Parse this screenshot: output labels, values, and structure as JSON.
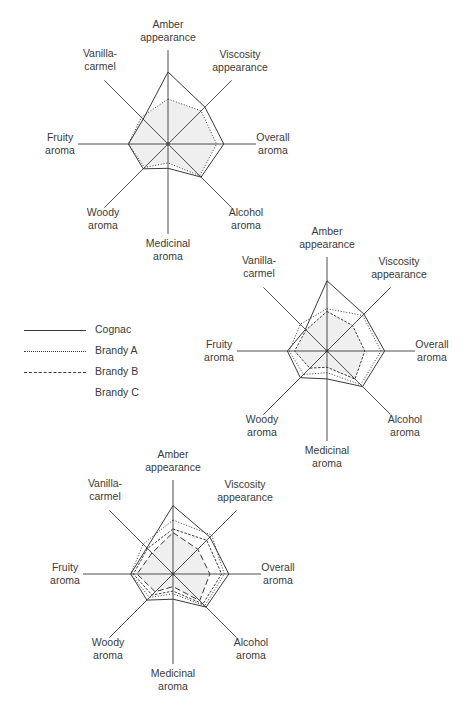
{
  "chart_data": [
    {
      "type": "radar",
      "title": "",
      "center": [
        168,
        144
      ],
      "radius_px": 90,
      "scale": [
        0,
        10
      ],
      "grid": false,
      "axes": [
        "Amber appearance",
        "Viscosity appearance",
        "Overall aroma",
        "Alcohol aroma",
        "Medicinal aroma",
        "Woody aroma",
        "Fruity aroma",
        "Vanilla-carmel"
      ],
      "series": [
        {
          "name": "Cognac",
          "style": "solid",
          "values": [
            8.0,
            5.8,
            6.2,
            5.2,
            2.7,
            3.9,
            4.4,
            3.9
          ]
        },
        {
          "name": "Brandy A",
          "style": "dotted",
          "values": [
            5.0,
            5.2,
            5.4,
            5.0,
            2.1,
            3.7,
            4.4,
            4.2
          ]
        }
      ]
    },
    {
      "type": "radar",
      "title": "",
      "center": [
        327,
        351
      ],
      "radius_px": 90,
      "scale": [
        0,
        10
      ],
      "grid": false,
      "axes": [
        "Amber appearance",
        "Viscosity appearance",
        "Overall aroma",
        "Alcohol aroma",
        "Medicinal aroma",
        "Woody aroma",
        "Fruity aroma",
        "Vanilla-carmel"
      ],
      "series": [
        {
          "name": "Cognac",
          "style": "solid",
          "values": [
            7.8,
            5.8,
            6.4,
            5.6,
            3.1,
            4.2,
            4.4,
            3.4
          ]
        },
        {
          "name": "Brandy A",
          "style": "dotted",
          "values": [
            4.7,
            5.6,
            6.0,
            5.3,
            2.4,
            3.7,
            4.2,
            4.2
          ]
        },
        {
          "name": "Brandy B",
          "style": "short-dash",
          "values": [
            4.4,
            4.0,
            4.2,
            4.4,
            1.8,
            2.7,
            3.6,
            3.3
          ]
        }
      ]
    },
    {
      "type": "radar",
      "title": "",
      "center": [
        173,
        574
      ],
      "radius_px": 90,
      "scale": [
        0,
        10
      ],
      "grid": false,
      "axes": [
        "Amber appearance",
        "Viscosity appearance",
        "Overall aroma",
        "Alcohol aroma",
        "Medicinal aroma",
        "Woody aroma",
        "Fruity aroma",
        "Vanilla-carmel"
      ],
      "series": [
        {
          "name": "Cognac",
          "style": "solid",
          "values": [
            7.6,
            5.8,
            6.2,
            5.2,
            2.8,
            4.1,
            4.7,
            4.1
          ]
        },
        {
          "name": "Brandy A",
          "style": "dotted",
          "values": [
            6.0,
            6.1,
            5.7,
            5.0,
            2.2,
            3.7,
            4.7,
            4.7
          ]
        },
        {
          "name": "Brandy B",
          "style": "short-dash",
          "values": [
            5.0,
            5.3,
            5.4,
            4.7,
            1.9,
            3.3,
            4.4,
            4.0
          ]
        },
        {
          "name": "Brandy C",
          "style": "long-dash",
          "values": [
            4.6,
            3.9,
            4.1,
            4.2,
            1.4,
            2.8,
            4.0,
            3.3
          ]
        }
      ]
    }
  ],
  "axis_labels": [
    [
      "Amber",
      "appearance"
    ],
    [
      "Viscosity",
      "appearance"
    ],
    [
      "Overall",
      "aroma"
    ],
    [
      "Alcohol",
      "aroma"
    ],
    [
      "Medicinal",
      "aroma"
    ],
    [
      "Woody",
      "aroma"
    ],
    [
      "Fruity",
      "aroma"
    ],
    [
      "Vanilla-",
      "carmel"
    ]
  ],
  "legend": {
    "position": "left-middle",
    "items": [
      {
        "label": "Cognac",
        "style": "solid"
      },
      {
        "label": "Brandy A",
        "style": "dotted"
      },
      {
        "label": "Brandy B",
        "style": "short-dash"
      },
      {
        "label": "Brandy C",
        "style": "long-dash"
      }
    ]
  },
  "colors": {
    "line": "#3a3a3a",
    "fill": "#efefef",
    "text": "#3a3a3a",
    "background": "#ffffff"
  }
}
